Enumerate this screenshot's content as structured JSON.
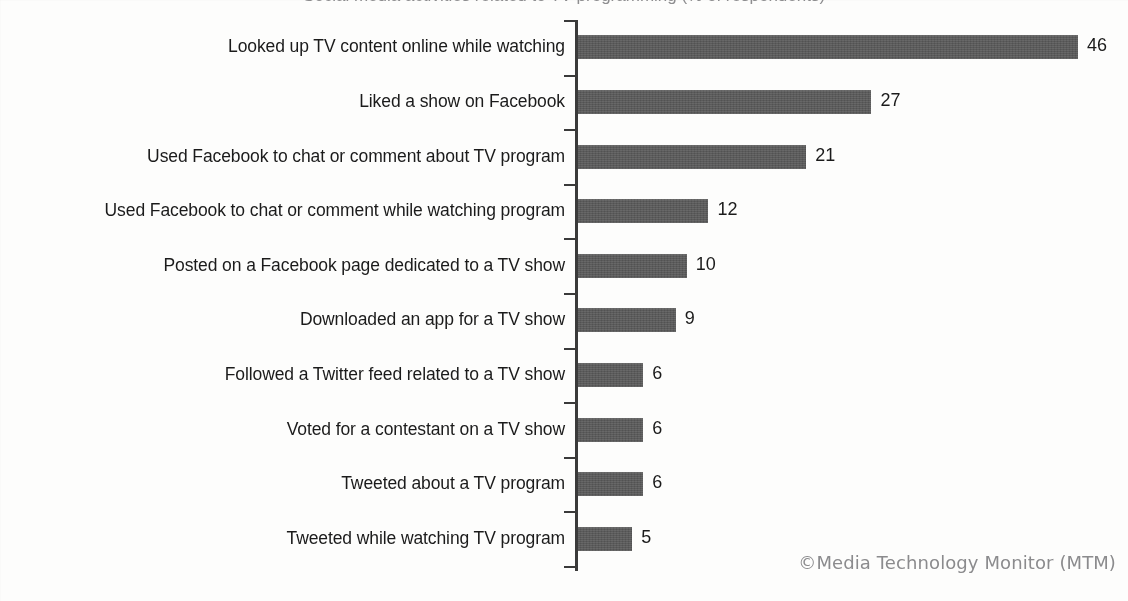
{
  "attribution": "©Media Technology Monitor (MTM)",
  "title_sliver": "Social media activities related to TV programming (% of respondents)",
  "colors": {
    "bar_fill": "#595959",
    "axis": "#3a3a3a",
    "label_text": "#1b1b1b",
    "attribution_text": "#8b8b8d",
    "background": "#fdfdfc"
  },
  "chart_data": {
    "type": "bar",
    "orientation": "horizontal",
    "title": "",
    "xlabel": "",
    "ylabel": "",
    "xlim": [
      0,
      46
    ],
    "grid": false,
    "legend": false,
    "value_labels": true,
    "categories": [
      "Looked up TV content online while watching",
      "Liked a show on Facebook",
      "Used Facebook to chat or comment about TV program",
      "Used Facebook to chat or comment while watching program",
      "Posted on a Facebook page dedicated to a TV show",
      "Downloaded an app for a TV show",
      "Followed a Twitter feed related to a TV show",
      "Voted for a contestant on a TV show",
      "Tweeted about a TV program",
      "Tweeted while watching TV program"
    ],
    "values": [
      46,
      27,
      21,
      12,
      10,
      9,
      6,
      6,
      6,
      5
    ],
    "value_label_strings": [
      "46",
      "27",
      "21",
      "12",
      "10",
      "9",
      "6",
      "6",
      "6",
      "5"
    ]
  }
}
